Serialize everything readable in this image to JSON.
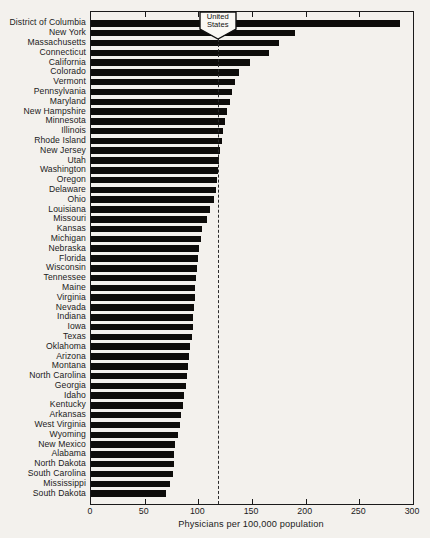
{
  "chart_data": {
    "type": "bar",
    "orientation": "horizontal",
    "title": "",
    "xlabel": "Physicians per 100,000 population",
    "ylabel": "",
    "xlim": [
      0,
      300
    ],
    "xticks": [
      0,
      50,
      100,
      150,
      200,
      250,
      300
    ],
    "grid": false,
    "legend": "none",
    "bar_color": "#0d0c0a",
    "background_color": "#f3f1ed",
    "frame_color": "#1a1a1a",
    "categories": [
      "District of Columbia",
      "New York",
      "Massachusetts",
      "Connecticut",
      "California",
      "Colorado",
      "Vermont",
      "Pennsylvania",
      "Maryland",
      "New Hampshire",
      "Minnesota",
      "Illinois",
      "Rhode Island",
      "New Jersey",
      "Utah",
      "Washington",
      "Oregon",
      "Delaware",
      "Ohio",
      "Louisiana",
      "Missouri",
      "Kansas",
      "Michigan",
      "Nebraska",
      "Florida",
      "Wisconsin",
      "Tennessee",
      "Maine",
      "Virginia",
      "Nevada",
      "Indiana",
      "Iowa",
      "Texas",
      "Oklahoma",
      "Arizona",
      "Montana",
      "North Carolina",
      "Georgia",
      "Idaho",
      "Kentucky",
      "Arkansas",
      "West Virginia",
      "Wyoming",
      "New Mexico",
      "Alabama",
      "North Dakota",
      "South Carolina",
      "Mississippi",
      "South Dakota"
    ],
    "values": [
      288,
      190,
      175,
      166,
      148,
      138,
      134,
      131,
      129,
      127,
      125,
      123,
      122,
      120,
      119,
      118,
      117,
      116,
      115,
      111,
      108,
      103,
      102,
      101,
      100,
      99,
      98,
      97,
      97,
      96,
      95,
      95,
      94,
      92,
      91,
      90,
      89,
      88,
      87,
      86,
      84,
      83,
      81,
      78,
      77,
      77,
      76,
      74,
      70
    ],
    "reference_line": {
      "label": "United States",
      "lines": [
        "United",
        "States"
      ],
      "value": 118
    }
  }
}
